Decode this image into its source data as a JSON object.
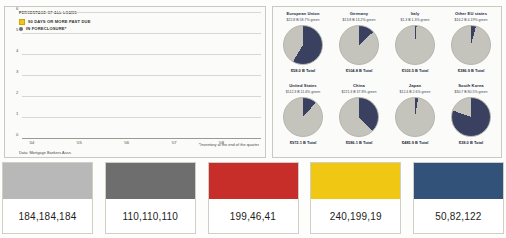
{
  "bar_panel": {
    "title": "PERCENTAGE OF ALL LOANS",
    "legend": [
      {
        "label": "90 DAYS OR MORE PAST DUE",
        "swatch": "yellow-square-icon",
        "color": "#f0c713"
      },
      {
        "label": "IN FORECLOSURE*",
        "swatch": "grey-circle-icon",
        "color": "#6e6e6e"
      }
    ],
    "source": "Data: Mortgage Bankers Assn.",
    "footnote": "*Inventory at the end of the quarter"
  },
  "chart_data": [
    {
      "type": "bar",
      "title": "PERCENTAGE OF ALL LOANS",
      "xlabel": "",
      "ylabel": "Percentage of all loans",
      "ylim": [
        0,
        6
      ],
      "yticks": [
        0,
        1,
        2,
        3,
        4,
        5,
        6
      ],
      "grid": true,
      "stacked": true,
      "legend_position": "top-left",
      "categories": [
        "'04 Q1",
        "'04 Q2",
        "'04 Q3",
        "'04 Q4",
        "'05 Q1",
        "'05 Q2",
        "'05 Q3",
        "'05 Q4",
        "'06 Q1",
        "'06 Q2",
        "'06 Q3",
        "'06 Q4",
        "'07 Q1",
        "'07 Q2",
        "'07 Q3",
        "'07 Q4",
        "'08 Q1",
        "'08 Q2",
        "'08 Q3",
        "'08 Q4"
      ],
      "xtick_labels": [
        "'04",
        "'05",
        "'06",
        "'07",
        "'08"
      ],
      "series": [
        {
          "name": "IN FORECLOSURE*",
          "color": "#6e6e6e",
          "values": [
            1.28,
            1.18,
            1.15,
            1.15,
            1.08,
            1.05,
            1.02,
            1.02,
            1.02,
            1.02,
            1.05,
            1.2,
            1.3,
            1.42,
            1.72,
            2.1,
            2.5,
            2.78,
            3.02,
            3.02
          ]
        },
        {
          "name": "90 DAYS OR MORE PAST DUE",
          "color": "#f0c713",
          "values": [
            0.9,
            0.84,
            0.85,
            0.85,
            0.82,
            0.82,
            0.88,
            1.02,
            0.93,
            0.92,
            0.97,
            1.0,
            1.0,
            1.15,
            1.28,
            1.46,
            1.62,
            1.85,
            2.18,
            2.18
          ]
        }
      ],
      "totals": [
        2.18,
        2.02,
        2.0,
        2.0,
        1.9,
        1.87,
        1.9,
        2.04,
        1.95,
        1.94,
        2.02,
        2.2,
        2.3,
        2.57,
        3.0,
        3.56,
        4.12,
        4.63,
        5.2,
        5.2
      ]
    },
    {
      "type": "pie",
      "title": "Foreign holdings of U.S. agency debt",
      "panels": [
        {
          "name": "European Union",
          "amount": "$22.8 B",
          "share_label": "58.7% green",
          "share": 58.7,
          "total": "$58.0 B Total"
        },
        {
          "name": "Germany",
          "amount": "$13.8 B",
          "share_label": "13.2% green",
          "share": 13.2,
          "total": "$104.8 B Total"
        },
        {
          "name": "Italy",
          "amount": "$1.3 B",
          "share_label": "1.3% green",
          "share": 1.3,
          "total": "$103.5 B Total"
        },
        {
          "name": "Other EU states",
          "amount": "$16.2 B",
          "share_label": "4.19% green",
          "share": 4.19,
          "total": "$386.9 B Total"
        },
        {
          "name": "United States",
          "amount": "$112.3 B",
          "share_label": "11.6% green",
          "share": 11.6,
          "total": "$972.1 B Total"
        },
        {
          "name": "China",
          "amount": "$221.3 B",
          "share_label": "37.8% green",
          "share": 37.8,
          "total": "$586.1 B Total"
        },
        {
          "name": "Japan",
          "amount": "$12.4 B",
          "share_label": "2.6% green",
          "share": 2.6,
          "total": "$485.9 B Total"
        },
        {
          "name": "South Korea",
          "amount": "$30.7 B",
          "share_label": "80.5% green",
          "share": 80.5,
          "total": "$38.0 B Total"
        }
      ],
      "slice_color": "#3a4160",
      "remainder_color": "#c4c4bd"
    }
  ],
  "swatches": [
    {
      "label": "184,184,184",
      "color": "#b8b8b8"
    },
    {
      "label": "110,110,110",
      "color": "#6e6e6e"
    },
    {
      "label": "199,46,41",
      "color": "#c72e29"
    },
    {
      "label": "240,199,19",
      "color": "#f0c713"
    },
    {
      "label": "50,82,122",
      "color": "#32527a"
    }
  ]
}
